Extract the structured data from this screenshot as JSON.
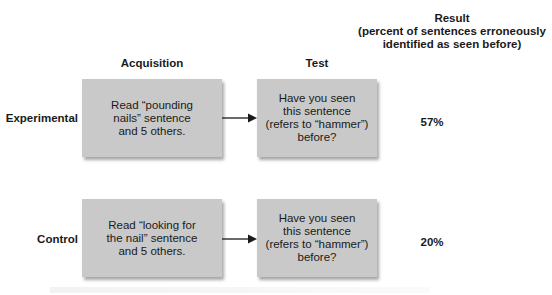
{
  "headers": {
    "acquisition": "Acquisition",
    "test": "Test",
    "result_lines": [
      "Result",
      "(percent of sentences erroneously",
      "identified as seen before)"
    ]
  },
  "rows": [
    {
      "label": "Experimental",
      "acquisition_lines": [
        "Read “pounding",
        "nails” sentence",
        "and 5 others."
      ],
      "test_lines": [
        "Have you seen",
        "this sentence",
        "(refers to “hammer”)",
        "before?"
      ],
      "result": "57%"
    },
    {
      "label": "Control",
      "acquisition_lines": [
        "Read “looking for",
        "the nail” sentence",
        "and 5 others."
      ],
      "test_lines": [
        "Have you seen",
        "this sentence",
        "(refers to “hammer”)",
        "before?"
      ],
      "result": "20%"
    }
  ],
  "colors": {
    "box_fill": "#c9c9c9",
    "text": "#1a1a1a",
    "arrow": "#1a1a1a"
  }
}
